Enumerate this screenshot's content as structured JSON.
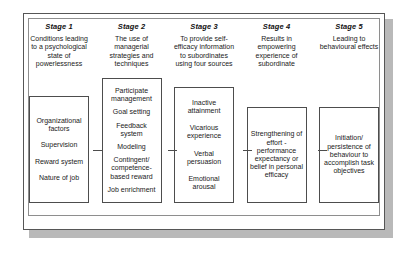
{
  "figure": {
    "frame_border_color": "#565656",
    "inner_border_color": "#8e8e8e",
    "box_border_color": "#4d4d4d",
    "shadow_color": "#b9b9b9",
    "text_color": "#1a1a1a"
  },
  "stages": [
    {
      "title": "Stage 1",
      "description": "Conditions leading to a psychological state of powerlessness",
      "items": [
        "Organizational factors",
        "Supervision",
        "Reward system",
        "Nature of job"
      ]
    },
    {
      "title": "Stage 2",
      "description": "The use of managerial strategies and techniques",
      "items": [
        "Participate management",
        "Goal setting",
        "Feedback system",
        "Modeling",
        "Contingent/ competence- based reward",
        "Job enrichment"
      ]
    },
    {
      "title": "Stage 3",
      "description": "To provide self-efficacy information to subordinates using four sources",
      "items": [
        "Inactive attainment",
        "Vicarious experience",
        "Verbal persuasion",
        "Emotional arousal"
      ]
    },
    {
      "title": "Stage 4",
      "description": "Results in empowering experience of subordinate",
      "items": [
        "Strengthening of effort - performance expectancy or belief in personal efficacy"
      ]
    },
    {
      "title": "Stage 5",
      "description": "Leading to behavioural effects",
      "items": [
        "Initiation/ persistence of behaviour to accomplish task objectives"
      ]
    }
  ]
}
